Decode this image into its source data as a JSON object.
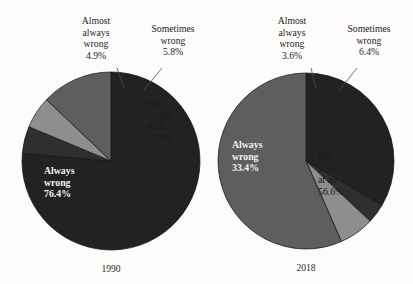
{
  "figure": {
    "background_color": "#fdfcfb",
    "palette": {
      "always_wrong": "#222222",
      "almost_always_wrong": "#2f2f2f",
      "sometimes_wrong": "#8e8e8e",
      "not_wrong_at_all": "#5e5e5e",
      "slice_outline": "#111111",
      "leader_line": "#4b4b4b",
      "dark_text": "#1a1a1a",
      "light_text": "#f2f1ef"
    }
  },
  "chart_data": [
    {
      "type": "pie",
      "title": "1990",
      "year": "1990",
      "center": {
        "x": 111,
        "y": 161
      },
      "radius": 89,
      "start_angle_deg": 0,
      "direction": "clockwise",
      "categories": [
        "Always wrong",
        "Almost always wrong",
        "Sometimes wrong",
        "Not wrong at all"
      ],
      "values": [
        76.4,
        4.9,
        5.8,
        12.9
      ],
      "slices": [
        {
          "label": "Always wrong",
          "value": 76.4,
          "value_text": "76.4%",
          "color": "#222222",
          "label_placement": "inside",
          "text_color": "#f2f1ef",
          "label_lines": [
            "Always",
            "wrong",
            "76.4%"
          ],
          "label_x": 44,
          "label_y": 174
        },
        {
          "label": "Almost always wrong",
          "value": 4.9,
          "value_text": "4.9%",
          "color": "#2f2f2f",
          "label_placement": "outside",
          "text_color": "#232323",
          "label_lines": [
            "Almost",
            "always",
            "wrong",
            "4.9%"
          ],
          "label_x": 96,
          "label_y": 24,
          "leader": {
            "x1": 117,
            "y1": 68,
            "x2": 124,
            "y2": 88
          }
        },
        {
          "label": "Sometimes wrong",
          "value": 5.8,
          "value_text": "5.8%",
          "color": "#8e8e8e",
          "label_placement": "outside",
          "text_color": "#232323",
          "label_lines": [
            "Sometimes",
            "wrong",
            "5.8%"
          ],
          "label_x": 173,
          "label_y": 32,
          "leader": {
            "x1": 162,
            "y1": 68,
            "x2": 144,
            "y2": 90
          }
        },
        {
          "label": "Not wrong at all",
          "value": 12.9,
          "value_text": "12.9%",
          "color": "#5e5e5e",
          "label_placement": "inside",
          "text_color": "#1a1a1a",
          "label_lines": [
            "Not",
            "wrong",
            "at all",
            "12.9%"
          ],
          "label_x": 146,
          "label_y": 106
        }
      ]
    },
    {
      "type": "pie",
      "title": "2018",
      "year": "2018",
      "center": {
        "x": 306,
        "y": 161
      },
      "radius": 88,
      "start_angle_deg": 0,
      "direction": "clockwise",
      "categories": [
        "Always wrong",
        "Almost always wrong",
        "Sometimes wrong",
        "Not wrong at all"
      ],
      "values": [
        33.4,
        3.6,
        6.4,
        56.6
      ],
      "slices": [
        {
          "label": "Always wrong",
          "value": 33.4,
          "value_text": "33.4%",
          "color": "#222222",
          "label_placement": "inside",
          "text_color": "#f2f1ef",
          "label_lines": [
            "Always",
            "wrong",
            "33.4%"
          ],
          "label_x": 232,
          "label_y": 148
        },
        {
          "label": "Almost always wrong",
          "value": 3.6,
          "value_text": "3.6%",
          "color": "#2f2f2f",
          "label_placement": "outside",
          "text_color": "#232323",
          "label_lines": [
            "Almost",
            "always",
            "wrong",
            "3.6%"
          ],
          "label_x": 292,
          "label_y": 24,
          "leader": {
            "x1": 311,
            "y1": 68,
            "x2": 316,
            "y2": 88
          }
        },
        {
          "label": "Sometimes wrong",
          "value": 6.4,
          "value_text": "6.4%",
          "color": "#8e8e8e",
          "label_placement": "outside",
          "text_color": "#232323",
          "label_lines": [
            "Sometimes",
            "wrong",
            "6.4%"
          ],
          "label_x": 369,
          "label_y": 32,
          "leader": {
            "x1": 357,
            "y1": 68,
            "x2": 338,
            "y2": 92
          }
        },
        {
          "label": "Not wrong at all",
          "value": 56.6,
          "value_text": "56.6%",
          "color": "#5e5e5e",
          "label_placement": "inside",
          "text_color": "#1a1a1a",
          "label_lines": [
            "Not",
            "wrong",
            "at all",
            "56.6%"
          ],
          "label_x": 318,
          "label_y": 160
        }
      ]
    }
  ]
}
